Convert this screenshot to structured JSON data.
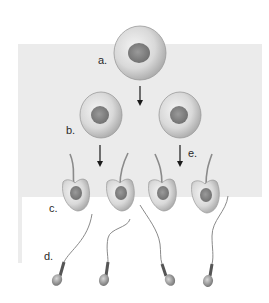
{
  "diagram": {
    "labels": {
      "a": "a.",
      "b": "b.",
      "c": "c.",
      "d": "d.",
      "e": "e."
    },
    "stages": [
      {
        "label": "a.",
        "description": "single large round cell (top)",
        "count": 1
      },
      {
        "label": "b.",
        "description": "two round cells (second row)",
        "count": 2
      },
      {
        "label": "c.",
        "description": "four cells with developing tails (third row)",
        "count": 4
      },
      {
        "label": "d.",
        "description": "four mature sperm cells (bottom)",
        "count": 4
      }
    ],
    "arrows": [
      {
        "from": "a",
        "to": "b"
      },
      {
        "from": "b-left",
        "to": "c"
      },
      {
        "from": "b-right",
        "to": "c",
        "label": "e."
      }
    ],
    "colors": {
      "panel": "#ebebeb",
      "cell_fill": "#d8d8d8",
      "nucleus": "#8a8a8a",
      "arrow": "#1a1a1a"
    }
  }
}
